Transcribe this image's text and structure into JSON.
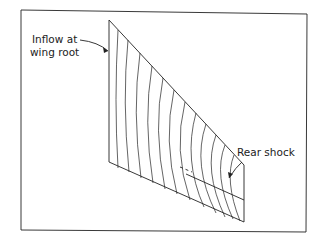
{
  "figure": {
    "labels": {
      "inflow_line1": "Inflow at",
      "inflow_line2": "wing root",
      "rear_shock": "Rear shock"
    },
    "stroke_color": "#222222",
    "background": "#ffffff"
  }
}
